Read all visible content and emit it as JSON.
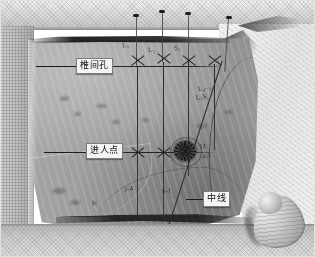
{
  "image": {
    "kind": "clinical-photograph",
    "modality": "surgical-site-marking-photo",
    "width": 315,
    "height": 257,
    "color_mode": "grayscale",
    "subject": "draped lumbar back with skin markings under transparent adhesive film",
    "palette": {
      "drape_light": "#cfcfcf",
      "drape_bright": "#efefef",
      "skin_mid": "#9a9a9a",
      "ink_black": "#1d1d1d",
      "label_fill": "#f4f4f4",
      "label_border": "#7c7c7c",
      "label_text": "#101010"
    }
  },
  "labels": [
    {
      "id": "foramen",
      "text": "椎间孔",
      "meaning_en": "intervertebral foramen",
      "box": {
        "x": 76,
        "y": 58,
        "w": 40,
        "h": 15
      },
      "leader": {
        "x": 36,
        "y": 66,
        "w": 40
      }
    },
    {
      "id": "entry-point",
      "text": "进人点",
      "meaning_en": "entry point",
      "box": {
        "x": 86,
        "y": 143,
        "w": 40,
        "h": 15
      },
      "leader": {
        "x": 44,
        "y": 152,
        "w": 42
      }
    },
    {
      "id": "midline",
      "text": "中线",
      "meaning_en": "midline",
      "box": {
        "x": 203,
        "y": 191,
        "w": 30,
        "h": 15
      },
      "leader": {
        "x": 186,
        "y": 199,
        "w": 17
      }
    }
  ],
  "markings": {
    "vertical_lines": [
      {
        "x": 137,
        "y_top": 66,
        "y_bottom": 215
      },
      {
        "x": 163,
        "y_top": 62,
        "y_bottom": 217
      },
      {
        "x": 188,
        "y_top": 62,
        "y_bottom": 176
      },
      {
        "x": 214,
        "y_top": 64,
        "y_bottom": 150
      }
    ],
    "needles_above_drape": [
      {
        "x": 136,
        "y_top": 16,
        "y_bottom": 66
      },
      {
        "x": 162,
        "y_top": 12,
        "y_bottom": 62
      },
      {
        "x": 188,
        "y_top": 14,
        "y_bottom": 62
      },
      {
        "x": 228,
        "y_top": 18,
        "y_bottom": 72
      }
    ],
    "horizontal_lines": [
      {
        "label": "foramen-line",
        "x": 36,
        "y": 66,
        "w": 185
      },
      {
        "label": "entry-line",
        "x": 44,
        "y": 152,
        "w": 168
      },
      {
        "label": "midline-trace",
        "x": 60,
        "y": 216,
        "w": 150
      }
    ],
    "diagonal_line": {
      "x": 222,
      "y": 60,
      "length": 170,
      "angle_deg": 108
    },
    "x_markers": [
      {
        "x": 130,
        "y": 58
      },
      {
        "x": 156,
        "y": 56
      },
      {
        "x": 182,
        "y": 58
      },
      {
        "x": 208,
        "y": 58
      },
      {
        "x": 130,
        "y": 145
      },
      {
        "x": 156,
        "y": 145
      }
    ],
    "starburst_entry": {
      "x": 176,
      "y": 141,
      "note": "inked needle entry point"
    }
  },
  "hand": {
    "present": true,
    "description": "gloved index finger touching drape at lower right",
    "x": 252,
    "y": 192
  },
  "scribbles": [
    {
      "text": "L₄",
      "x": 122,
      "y": 45,
      "size": 7,
      "rot": -8
    },
    {
      "text": "L₅",
      "x": 148,
      "y": 50,
      "size": 7,
      "rot": -6
    },
    {
      "text": "S₁",
      "x": 174,
      "y": 48,
      "size": 7,
      "rot": -5
    },
    {
      "text": "L₄₋₅",
      "x": 198,
      "y": 88,
      "size": 7,
      "rot": -12
    },
    {
      "text": "L₅S₁",
      "x": 196,
      "y": 96,
      "size": 7,
      "rot": -10
    },
    {
      "text": "Lt",
      "x": 200,
      "y": 146,
      "size": 7,
      "rot": -14
    },
    {
      "text": "4-5",
      "x": 202,
      "y": 156,
      "size": 7,
      "rot": -12
    },
    {
      "text": "3-4",
      "x": 124,
      "y": 188,
      "size": 7,
      "rot": -9
    },
    {
      "text": "Ic",
      "x": 92,
      "y": 202,
      "size": 7,
      "rot": -7
    },
    {
      "text": "5-1",
      "x": 162,
      "y": 190,
      "size": 7,
      "rot": -8
    }
  ]
}
